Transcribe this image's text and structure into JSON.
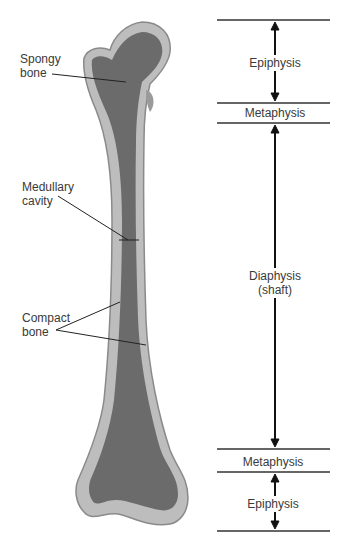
{
  "diagram": {
    "colors": {
      "compact_bone": "#b9b9b9",
      "spongy_bone": "#6a6a6a",
      "outline": "#8a8a8a",
      "leader_lines": "#222222",
      "boundary_lines": "#333333"
    },
    "left_labels": [
      {
        "id": "spongy",
        "lines": [
          "Spongy",
          "bone"
        ]
      },
      {
        "id": "medullary",
        "lines": [
          "Medullary",
          "cavity"
        ]
      },
      {
        "id": "compact",
        "lines": [
          "Compact",
          "bone"
        ]
      }
    ],
    "regions": [
      {
        "label": "Epiphysis"
      },
      {
        "label": "Metaphysis"
      },
      {
        "label": "Diaphysis",
        "sublabel": "(shaft)"
      },
      {
        "label": "Metaphysis"
      },
      {
        "label": "Epiphysis"
      }
    ]
  }
}
